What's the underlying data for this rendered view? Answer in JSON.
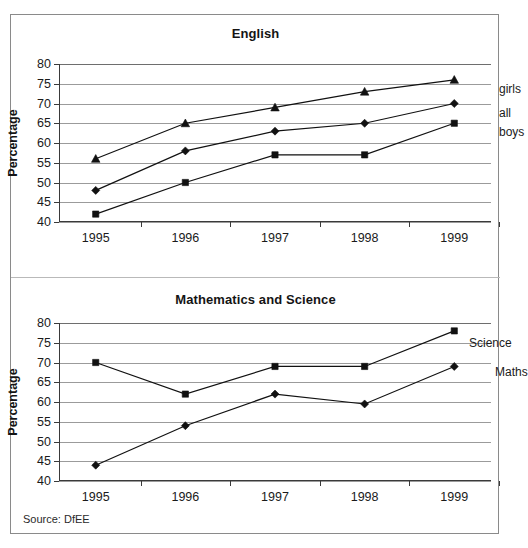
{
  "figure": {
    "source_note": "Source: DfEE",
    "axis_title": "Percentage",
    "years": [
      "1995",
      "1996",
      "1997",
      "1998",
      "1999"
    ],
    "y_ticks": [
      "40",
      "45",
      "50",
      "55",
      "60",
      "65",
      "70",
      "75",
      "80"
    ],
    "line_color": "#111111",
    "grid_color": "#9b9b9b"
  },
  "chart_data": [
    {
      "type": "line",
      "title": "English",
      "xlabel": "",
      "ylabel": "Percentage",
      "categories": [
        "1995",
        "1996",
        "1997",
        "1998",
        "1999"
      ],
      "ylim": [
        40,
        80
      ],
      "yticks": [
        40,
        45,
        50,
        55,
        60,
        65,
        70,
        75,
        80
      ],
      "grid": true,
      "legend_position": "right-inline",
      "series": [
        {
          "name": "girls",
          "marker": "triangle",
          "values": [
            56,
            65,
            69,
            73,
            76
          ]
        },
        {
          "name": "all",
          "marker": "diamond",
          "values": [
            48,
            58,
            63,
            65,
            70
          ]
        },
        {
          "name": "boys",
          "marker": "square",
          "values": [
            42,
            50,
            57,
            57,
            65
          ]
        }
      ]
    },
    {
      "type": "line",
      "title": "Mathematics and Science",
      "xlabel": "",
      "ylabel": "Percentage",
      "categories": [
        "1995",
        "1996",
        "1997",
        "1998",
        "1999"
      ],
      "ylim": [
        40,
        80
      ],
      "yticks": [
        40,
        45,
        50,
        55,
        60,
        65,
        70,
        75,
        80
      ],
      "grid": true,
      "legend_position": "right-inline",
      "series": [
        {
          "name": "Science",
          "marker": "square",
          "values": [
            70,
            62,
            69,
            69,
            78
          ]
        },
        {
          "name": "Maths",
          "marker": "diamond",
          "values": [
            44,
            54,
            62,
            59.5,
            69
          ]
        }
      ]
    }
  ]
}
